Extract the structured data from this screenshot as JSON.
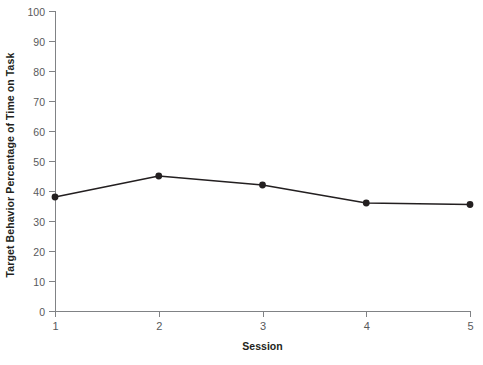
{
  "chart_data": {
    "type": "line",
    "title": "",
    "xlabel": "Session",
    "ylabel": "Target Behavior Percentage of Time on Task",
    "x": [
      1,
      2,
      3,
      4,
      5
    ],
    "values": [
      38,
      45,
      42,
      36,
      35.5
    ],
    "categories": [
      "1",
      "2",
      "3",
      "4",
      "5"
    ],
    "xlim": [
      1,
      5
    ],
    "ylim": [
      0,
      100
    ],
    "y_ticks": [
      0,
      10,
      20,
      30,
      40,
      50,
      60,
      70,
      80,
      90,
      100
    ],
    "y_tick_labels": [
      "0",
      "10",
      "20",
      "30",
      "40",
      "50",
      "60",
      "70",
      "80",
      "90",
      "100"
    ],
    "x_ticks": [
      1,
      2,
      3,
      4,
      5
    ],
    "x_tick_labels": [
      "1",
      "2",
      "3",
      "4",
      "5"
    ],
    "grid": false,
    "legend": false,
    "series": [
      {
        "name": "Target Behavior",
        "values": [
          38,
          45,
          42,
          36,
          35.5
        ],
        "marker": "circle",
        "line_color": "#231f20",
        "marker_color": "#231f20"
      }
    ],
    "colors": {
      "background": "#ffffff",
      "axis": "#808285",
      "tick_label": "#58595b",
      "axis_title": "#231f20",
      "line": "#231f20",
      "marker": "#231f20"
    }
  }
}
